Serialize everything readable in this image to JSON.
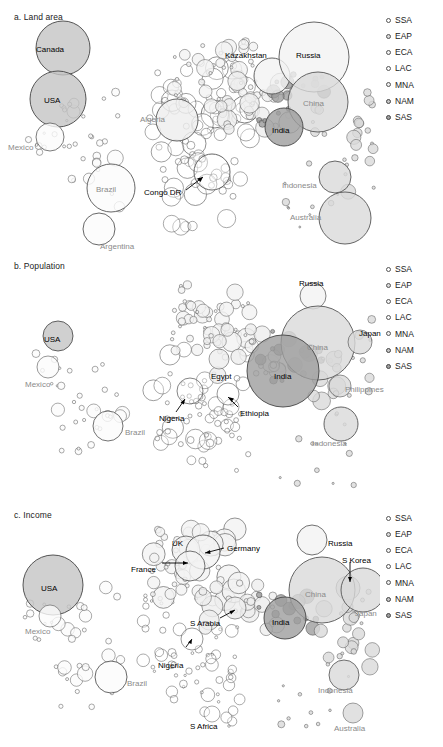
{
  "figure": {
    "type": "bubble-map-triptych",
    "background": "#ffffff",
    "width": 443,
    "height": 747
  },
  "legend": {
    "items": [
      {
        "code": "SSA",
        "fill": "#ffffff",
        "stroke": "#555555"
      },
      {
        "code": "EAP",
        "fill": "#d9d9d9",
        "stroke": "#555555"
      },
      {
        "code": "ECA",
        "fill": "#f2f2f2",
        "stroke": "#555555"
      },
      {
        "code": "LAC",
        "fill": "#fbfbfb",
        "stroke": "#555555"
      },
      {
        "code": "MNA",
        "fill": "#ededed",
        "stroke": "#555555"
      },
      {
        "code": "NAM",
        "fill": "#c4c4c4",
        "stroke": "#444444"
      },
      {
        "code": "SAS",
        "fill": "#9e9e9e",
        "stroke": "#444444"
      }
    ]
  },
  "panels": [
    {
      "id": "a",
      "title": "a. Land area",
      "labels": [
        {
          "text": "Canada",
          "x": 36,
          "y": 46,
          "tone": "dark"
        },
        {
          "text": "USA",
          "x": 44,
          "y": 97,
          "tone": "dark"
        },
        {
          "text": "Mexico",
          "x": 8,
          "y": 144,
          "tone": "gray"
        },
        {
          "text": "Brazil",
          "x": 96,
          "y": 186,
          "tone": "gray"
        },
        {
          "text": "Argentina",
          "x": 100,
          "y": 243,
          "tone": "gray"
        },
        {
          "text": "Algeria",
          "x": 140,
          "y": 116,
          "tone": "gray"
        },
        {
          "text": "Congo DR",
          "x": 144,
          "y": 189,
          "tone": "dark"
        },
        {
          "text": "Kazakhstan",
          "x": 225,
          "y": 52,
          "tone": "dark"
        },
        {
          "text": "Russia",
          "x": 296,
          "y": 52,
          "tone": "dark"
        },
        {
          "text": "China",
          "x": 303,
          "y": 100,
          "tone": "gray"
        },
        {
          "text": "India",
          "x": 272,
          "y": 127,
          "tone": "dark"
        },
        {
          "text": "Indonesia",
          "x": 282,
          "y": 182,
          "tone": "gray"
        },
        {
          "text": "Australia",
          "x": 290,
          "y": 214,
          "tone": "gray"
        }
      ]
    },
    {
      "id": "b",
      "title": "b. Population",
      "labels": [
        {
          "text": "USA",
          "x": 44,
          "y": 87,
          "tone": "dark"
        },
        {
          "text": "Mexico",
          "x": 25,
          "y": 132,
          "tone": "gray"
        },
        {
          "text": "Brazil",
          "x": 125,
          "y": 180,
          "tone": "gray"
        },
        {
          "text": "Nigeria",
          "x": 159,
          "y": 166,
          "tone": "dark"
        },
        {
          "text": "Ethiopia",
          "x": 240,
          "y": 161,
          "tone": "dark"
        },
        {
          "text": "Egypt",
          "x": 211,
          "y": 124,
          "tone": "dark"
        },
        {
          "text": "Russia",
          "x": 299,
          "y": 31,
          "tone": "dark"
        },
        {
          "text": "China",
          "x": 307,
          "y": 95,
          "tone": "gray"
        },
        {
          "text": "India",
          "x": 274,
          "y": 124,
          "tone": "dark"
        },
        {
          "text": "Japan",
          "x": 359,
          "y": 81,
          "tone": "dark"
        },
        {
          "text": "Philippines",
          "x": 345,
          "y": 137,
          "tone": "gray"
        },
        {
          "text": "Indonesia",
          "x": 312,
          "y": 191,
          "tone": "gray"
        }
      ]
    },
    {
      "id": "c",
      "title": "c. Income",
      "labels": [
        {
          "text": "USA",
          "x": 41,
          "y": 87,
          "tone": "dark"
        },
        {
          "text": "Mexico",
          "x": 25,
          "y": 130,
          "tone": "gray"
        },
        {
          "text": "Brazil",
          "x": 127,
          "y": 182,
          "tone": "gray"
        },
        {
          "text": "Nigeria",
          "x": 158,
          "y": 164,
          "tone": "dark"
        },
        {
          "text": "S Africa",
          "x": 190,
          "y": 225,
          "tone": "dark"
        },
        {
          "text": "UK",
          "x": 172,
          "y": 42,
          "tone": "dark"
        },
        {
          "text": "Germany",
          "x": 227,
          "y": 47,
          "tone": "dark"
        },
        {
          "text": "France",
          "x": 131,
          "y": 68,
          "tone": "dark"
        },
        {
          "text": "S Arabia",
          "x": 190,
          "y": 122,
          "tone": "dark"
        },
        {
          "text": "Russia",
          "x": 328,
          "y": 42,
          "tone": "dark"
        },
        {
          "text": "S Korea",
          "x": 342,
          "y": 59,
          "tone": "dark"
        },
        {
          "text": "China",
          "x": 305,
          "y": 93,
          "tone": "gray"
        },
        {
          "text": "India",
          "x": 272,
          "y": 121,
          "tone": "dark"
        },
        {
          "text": "Japan",
          "x": 355,
          "y": 112,
          "tone": "gray"
        },
        {
          "text": "Indonesia",
          "x": 318,
          "y": 189,
          "tone": "gray"
        },
        {
          "text": "Australia",
          "x": 334,
          "y": 227,
          "tone": "gray"
        }
      ]
    }
  ],
  "chart_data": {
    "type": "scatter",
    "xlabel": "",
    "ylabel": "",
    "grid": false,
    "legend_position": "right",
    "note": "Bubble area encodes the panel metric; fill shade encodes World Bank region code.",
    "region_codes": [
      "SSA",
      "EAP",
      "ECA",
      "LAC",
      "MNA",
      "NAM",
      "SAS"
    ],
    "series": [
      {
        "name": "a. Land area",
        "points": [
          {
            "label": "Canada",
            "x": 63,
            "y": 48,
            "r": 27,
            "region": "NAM"
          },
          {
            "label": "USA",
            "x": 58,
            "y": 99,
            "r": 28,
            "region": "NAM"
          },
          {
            "label": "Mexico",
            "x": 50,
            "y": 137,
            "r": 14,
            "region": "LAC"
          },
          {
            "label": "Brazil",
            "x": 111,
            "y": 188,
            "r": 24,
            "region": "LAC"
          },
          {
            "label": "Argentina",
            "x": 99,
            "y": 229,
            "r": 16,
            "region": "LAC"
          },
          {
            "label": "Algeria",
            "x": 177,
            "y": 120,
            "r": 21,
            "region": "MNA"
          },
          {
            "label": "Congo DR",
            "x": 212,
            "y": 172,
            "r": 18,
            "region": "SSA"
          },
          {
            "label": "Kazakhstan",
            "x": 272,
            "y": 76,
            "r": 18,
            "region": "ECA"
          },
          {
            "label": "Russia",
            "x": 314,
            "y": 57,
            "r": 35,
            "region": "ECA"
          },
          {
            "label": "China",
            "x": 318,
            "y": 102,
            "r": 30,
            "region": "EAP"
          },
          {
            "label": "India",
            "x": 284,
            "y": 127,
            "r": 19,
            "region": "SAS"
          },
          {
            "label": "Indonesia",
            "x": 335,
            "y": 177,
            "r": 16,
            "region": "EAP"
          },
          {
            "label": "Australia",
            "x": 345,
            "y": 218,
            "r": 26,
            "region": "EAP"
          }
        ]
      },
      {
        "name": "b. Population",
        "points": [
          {
            "label": "USA",
            "x": 58,
            "y": 87,
            "r": 15,
            "region": "NAM"
          },
          {
            "label": "Mexico",
            "x": 48,
            "y": 118,
            "r": 11,
            "region": "LAC"
          },
          {
            "label": "Brazil",
            "x": 108,
            "y": 177,
            "r": 15,
            "region": "LAC"
          },
          {
            "label": "Nigeria",
            "x": 190,
            "y": 142,
            "r": 13,
            "region": "SSA"
          },
          {
            "label": "Ethiopia",
            "x": 228,
            "y": 145,
            "r": 11,
            "region": "SSA"
          },
          {
            "label": "Egypt",
            "x": 219,
            "y": 110,
            "r": 10,
            "region": "MNA"
          },
          {
            "label": "Russia",
            "x": 313,
            "y": 47,
            "r": 13,
            "region": "ECA"
          },
          {
            "label": "China",
            "x": 318,
            "y": 94,
            "r": 37,
            "region": "EAP"
          },
          {
            "label": "India",
            "x": 283,
            "y": 122,
            "r": 36,
            "region": "SAS"
          },
          {
            "label": "Japan",
            "x": 360,
            "y": 93,
            "r": 12,
            "region": "EAP"
          },
          {
            "label": "Philippines",
            "x": 340,
            "y": 137,
            "r": 11,
            "region": "EAP"
          },
          {
            "label": "Indonesia",
            "x": 341,
            "y": 175,
            "r": 17,
            "region": "EAP"
          }
        ]
      },
      {
        "name": "c. Income",
        "points": [
          {
            "label": "USA",
            "x": 53,
            "y": 87,
            "r": 30,
            "region": "NAM"
          },
          {
            "label": "Mexico",
            "x": 50,
            "y": 118,
            "r": 11,
            "region": "LAC"
          },
          {
            "label": "Brazil",
            "x": 111,
            "y": 179,
            "r": 16,
            "region": "LAC"
          },
          {
            "label": "Nigeria",
            "x": 192,
            "y": 141,
            "r": 11,
            "region": "SSA"
          },
          {
            "label": "S Africa",
            "x": 212,
            "y": 216,
            "r": 8,
            "region": "SSA"
          },
          {
            "label": "UK",
            "x": 186,
            "y": 52,
            "r": 14,
            "region": "ECA"
          },
          {
            "label": "Germany",
            "x": 203,
            "y": 54,
            "r": 17,
            "region": "ECA"
          },
          {
            "label": "France",
            "x": 190,
            "y": 68,
            "r": 15,
            "region": "ECA"
          },
          {
            "label": "S Arabia",
            "x": 235,
            "y": 110,
            "r": 11,
            "region": "MNA"
          },
          {
            "label": "Russia",
            "x": 312,
            "y": 42,
            "r": 15,
            "region": "ECA"
          },
          {
            "label": "S Korea",
            "x": 348,
            "y": 90,
            "r": 12,
            "region": "EAP"
          },
          {
            "label": "China",
            "x": 322,
            "y": 92,
            "r": 33,
            "region": "EAP"
          },
          {
            "label": "India",
            "x": 285,
            "y": 120,
            "r": 21,
            "region": "SAS"
          },
          {
            "label": "Japan",
            "x": 363,
            "y": 92,
            "r": 22,
            "region": "EAP"
          },
          {
            "label": "Indonesia",
            "x": 344,
            "y": 177,
            "r": 15,
            "region": "EAP"
          },
          {
            "label": "Australia",
            "x": 353,
            "y": 215,
            "r": 10,
            "region": "EAP"
          }
        ]
      }
    ]
  }
}
